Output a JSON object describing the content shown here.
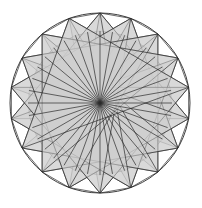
{
  "figure": {
    "canvas": {
      "width": 202,
      "height": 208,
      "background": "#ffffff"
    },
    "geometry": {
      "center_x": 100,
      "center_y": 103,
      "outer_radius": 90,
      "points": 18,
      "star_step": 5,
      "rotation_deg": -90
    },
    "colors": {
      "stroke": "#2b2b2b",
      "background": "#ffffff",
      "ring_1": "#ffffff",
      "ring_2": "#d6d6d6",
      "ring_3": "#bdbdbd",
      "ring_4": "#a2a2a2",
      "ring_5": "#7e7e7e",
      "ring_6": "#5c5c5c",
      "ring_7": "#3d3d3d",
      "ring_8": "#232323",
      "ring_9": "#101010"
    },
    "rings": [
      {
        "name": "rim-band",
        "radius": 90,
        "fill": "#ffffff"
      },
      {
        "name": "outer-star-band",
        "radius": 72,
        "fill": "#d6d6d6"
      },
      {
        "name": "band-3",
        "radius": 60,
        "fill": "#c4c4c4"
      },
      {
        "name": "band-4",
        "radius": 50,
        "fill": "#a8a8a8"
      },
      {
        "name": "band-5",
        "radius": 41,
        "fill": "#8a8a8a"
      },
      {
        "name": "band-6",
        "radius": 33,
        "fill": "#6a6a6a"
      },
      {
        "name": "band-7",
        "radius": 25,
        "fill": "#4a4a4a"
      },
      {
        "name": "band-8",
        "radius": 17,
        "fill": "#2e2e2e"
      },
      {
        "name": "band-9",
        "radius": 10,
        "fill": "#1a1a1a"
      },
      {
        "name": "core",
        "radius": 4,
        "fill": "#0c0c0c"
      }
    ],
    "star_wedge_fill": "#cfcfcf",
    "star_wedge_opacity": 0.55,
    "spoke_count": 36
  }
}
